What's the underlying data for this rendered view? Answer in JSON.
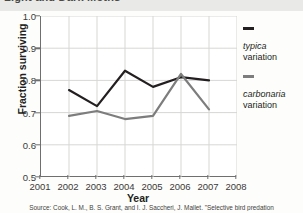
{
  "figure": {
    "title": "Light and Dark Moths",
    "source": "Source: Cook, L. M., B. S. Grant, and I. J. Saccheri, J. Mallet. \"Selective bird predation"
  },
  "legend": {
    "position": "right",
    "items": [
      {
        "name": "typica",
        "sub": "variation",
        "color": "#231f20"
      },
      {
        "name": "carbonaria",
        "sub": "variation",
        "color": "#7d7d7d"
      }
    ]
  },
  "chart_data": {
    "type": "line",
    "title": "Light and Dark Moths",
    "xlabel": "Year",
    "ylabel": "Fraction surviving",
    "xlim": [
      2001,
      2008
    ],
    "ylim": [
      0.5,
      1.0
    ],
    "grid": true,
    "xticks": [
      2001,
      2002,
      2003,
      2004,
      2005,
      2006,
      2007,
      2008
    ],
    "xtick_labels": [
      "2001",
      "2002",
      "2003",
      "2004",
      "2005",
      "2006",
      "2007",
      "2008"
    ],
    "yticks": [
      0.5,
      0.6,
      0.7,
      0.8,
      0.9,
      1.0
    ],
    "ytick_labels": [
      "0.5",
      "0.6",
      "0.7",
      "0.8",
      "0.9",
      "1.0"
    ],
    "x": [
      2002,
      2003,
      2004,
      2005,
      2006,
      2007
    ],
    "series": [
      {
        "name": "typica variation",
        "color": "#231f20",
        "values": [
          0.77,
          0.72,
          0.83,
          0.78,
          0.81,
          0.8
        ]
      },
      {
        "name": "carbonaria variation",
        "color": "#7d7d7d",
        "values": [
          0.69,
          0.705,
          0.68,
          0.69,
          0.82,
          0.71
        ]
      }
    ]
  }
}
